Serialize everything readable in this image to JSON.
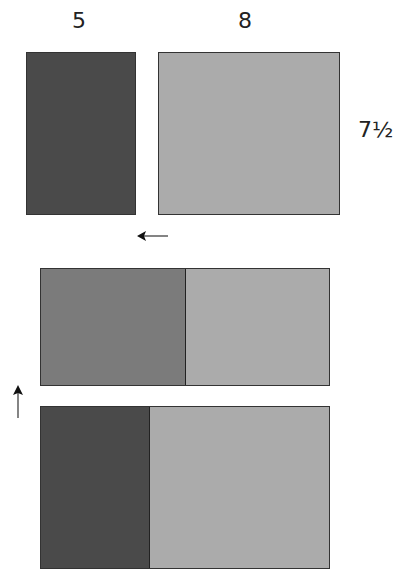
{
  "top": {
    "width_left_label": "5",
    "width_right_label": "8",
    "height_label": "7½"
  },
  "colors": {
    "dark": "#4a4a4a",
    "mid": "#7b7b7b",
    "light": "#ababab"
  },
  "arrows": {
    "left": "←",
    "up": "↑"
  }
}
